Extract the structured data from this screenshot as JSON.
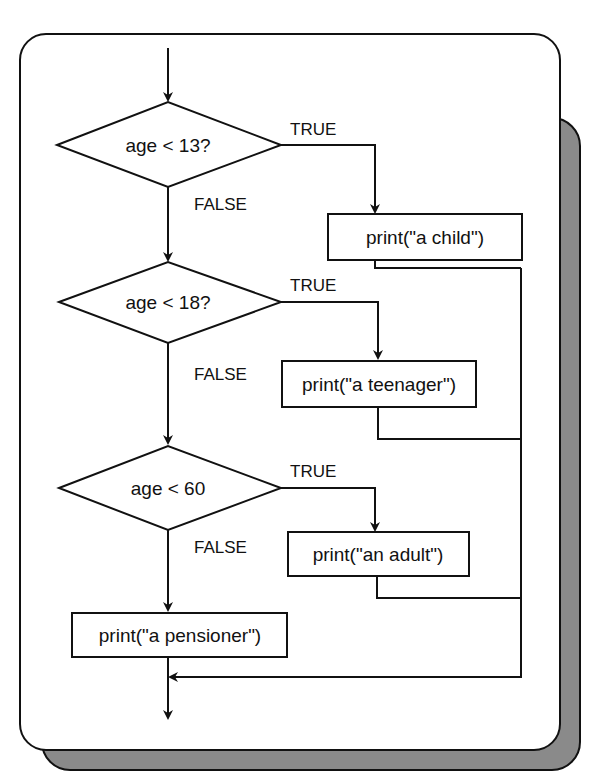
{
  "diagram": {
    "type": "flowchart",
    "decisions": [
      {
        "label": "age < 13?",
        "true_label": "TRUE",
        "false_label": "FALSE"
      },
      {
        "label": "age < 18?",
        "true_label": "TRUE",
        "false_label": "FALSE"
      },
      {
        "label": "age < 60",
        "true_label": "TRUE",
        "false_label": "FALSE"
      }
    ],
    "actions": [
      {
        "label": "print(\"a child\")"
      },
      {
        "label": "print(\"a teenager\")"
      },
      {
        "label": "print(\"an adult\")"
      },
      {
        "label": "print(\"a pensioner\")"
      }
    ],
    "colors": {
      "panel": "#ffffff",
      "shadow": "#8a8a8a",
      "stroke": "#111111"
    }
  }
}
